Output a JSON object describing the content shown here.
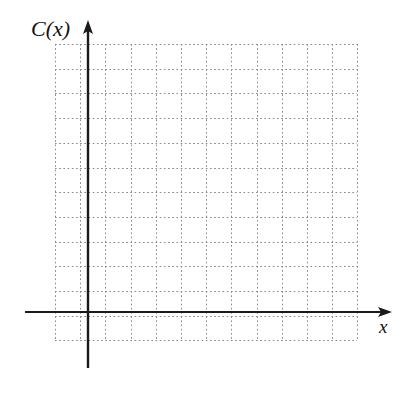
{
  "figure": {
    "type": "blank-cartesian-grid",
    "width": 414,
    "height": 393,
    "background_color": "#ffffff"
  },
  "axes": {
    "vertical": {
      "label": "C(x)",
      "name": "y-axis",
      "color": "#1a1a1a",
      "arrow": "up",
      "x_px": 88,
      "top_px": 20,
      "bottom_px": 368
    },
    "horizontal": {
      "label": "x",
      "name": "x-axis",
      "color": "#1a1a1a",
      "arrow": "right",
      "y_px": 312,
      "left_px": 25,
      "right_px": 392
    },
    "origin": {
      "x_px": 88,
      "y_px": 312
    }
  },
  "grid": {
    "style": "dotted",
    "color": "#8a8a92",
    "left_px": 55,
    "top_px": 44,
    "right_px": 357,
    "bottom_px": 340,
    "cell_width_px": 25.2,
    "cell_height_px": 24.7,
    "columns": 12,
    "rows": 12,
    "vertical_lines_px": [
      55,
      80.2,
      88,
      105.4,
      130.6,
      155.8,
      181,
      206.2,
      231.4,
      256.6,
      281.8,
      307,
      332.2,
      357
    ],
    "horizontal_lines_px": [
      44,
      68.7,
      93.4,
      118.1,
      142.8,
      167.5,
      192.2,
      216.9,
      241.6,
      266.3,
      291,
      312,
      315.7,
      340
    ]
  },
  "chart_data": {
    "type": "line",
    "title": "",
    "subtitle": "",
    "xlabel": "x",
    "ylabel": "C(x)",
    "series": [],
    "categories": [],
    "x": [],
    "values": [],
    "annotations": [],
    "legend": {
      "entries": [],
      "position": "none"
    },
    "grid": true,
    "grid_style": "dotted",
    "xlim": [
      -1.3,
      11
    ],
    "ylim": [
      -1.1,
      11
    ],
    "xticks": [],
    "yticks": [],
    "xticklabels": [],
    "yticklabels": [],
    "note": "Empty grid provided for the reader to sketch a graph of C(x); no data points, curves, tick numbers, or legend are drawn."
  }
}
